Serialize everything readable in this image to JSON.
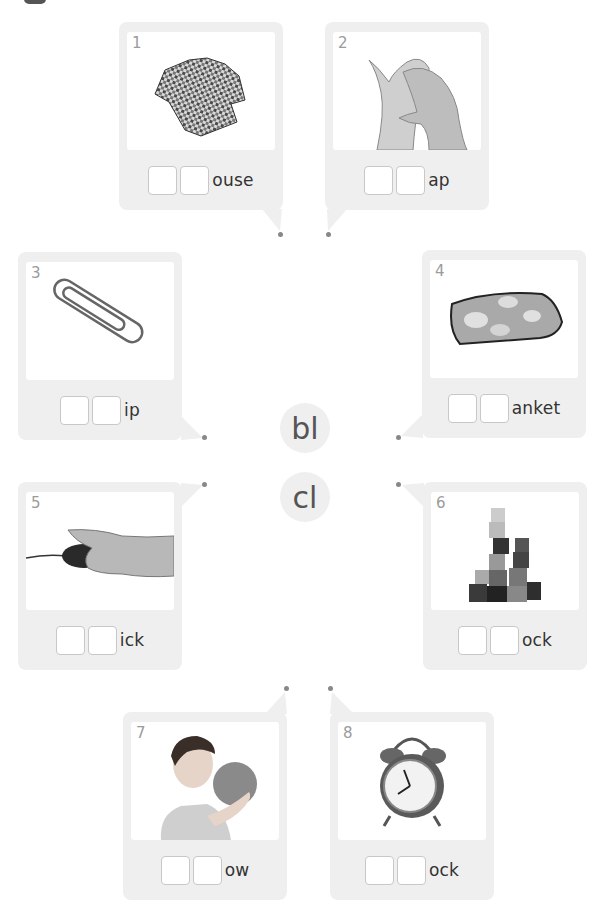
{
  "exercise": {
    "blends": [
      "bl",
      "cl"
    ],
    "items": [
      {
        "number": "1",
        "picture": "checked shirt",
        "ending": "ouse",
        "answer_boxes": 2
      },
      {
        "number": "2",
        "picture": "clapping hands",
        "ending": "ap",
        "answer_boxes": 2
      },
      {
        "number": "3",
        "picture": "paper clip",
        "ending": "ip",
        "answer_boxes": 2
      },
      {
        "number": "4",
        "picture": "folded blanket",
        "ending": "anket",
        "answer_boxes": 2
      },
      {
        "number": "5",
        "picture": "hand clicking mouse",
        "ending": "ick",
        "answer_boxes": 2
      },
      {
        "number": "6",
        "picture": "stacked blocks",
        "ending": "ock",
        "answer_boxes": 2
      },
      {
        "number": "7",
        "picture": "boy blowing balloon",
        "ending": "ow",
        "answer_boxes": 2
      },
      {
        "number": "8",
        "picture": "alarm clock",
        "ending": "ock",
        "answer_boxes": 2
      }
    ]
  },
  "colors": {
    "card_bg": "#efefef",
    "blend_text": "#555555",
    "number_text": "#9b9b9b",
    "word_text": "#333333",
    "dot": "#888888"
  }
}
